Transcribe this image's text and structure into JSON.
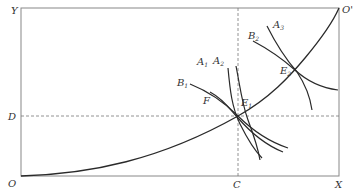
{
  "diagram": {
    "type": "edgeworth-box",
    "colors": {
      "axis": "#888888",
      "curve": "#2a2a2a",
      "dash": "#777777",
      "text": "#333333"
    },
    "origins": {
      "bottom_left": "O",
      "top_right": "O'"
    },
    "axis_labels": {
      "y": "Y",
      "x": "X",
      "c": "C",
      "d": "D"
    },
    "points": {
      "f": "F",
      "e1": {
        "main": "E",
        "sub": "1"
      },
      "e2": {
        "main": "E",
        "sub": "2"
      }
    },
    "curves": {
      "a1": {
        "main": "A",
        "sub": "1"
      },
      "a2": {
        "main": "A",
        "sub": "2"
      },
      "a3": {
        "main": "A",
        "sub": "3"
      },
      "b1": {
        "main": "B",
        "sub": "1"
      },
      "b2": {
        "main": "B",
        "sub": "2"
      }
    }
  }
}
